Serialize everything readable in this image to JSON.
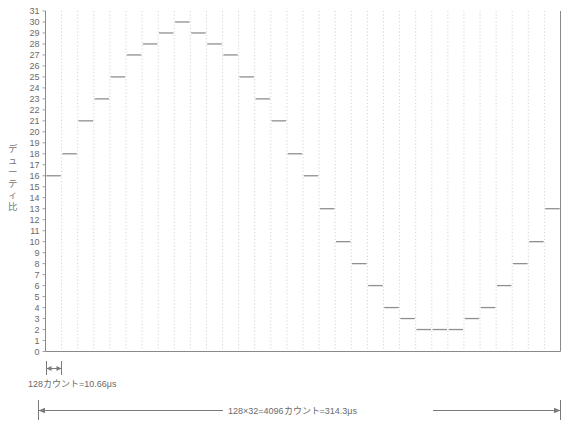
{
  "figure": {
    "caption_hidden": "",
    "axis": {
      "y_label": "デューティ比",
      "y_label_chars": [
        "デ",
        "ュ",
        "ー",
        "テ",
        "ィ",
        "比"
      ],
      "y_ticks": [
        0,
        1,
        2,
        3,
        4,
        5,
        6,
        7,
        8,
        9,
        10,
        11,
        12,
        13,
        14,
        15,
        16,
        17,
        18,
        19,
        20,
        21,
        22,
        23,
        24,
        25,
        26,
        27,
        28,
        29,
        30,
        31
      ],
      "y_min": 0,
      "y_max": 31
    },
    "annotations": {
      "step_marker": "128カウント=10.66μs",
      "total_span": "128×32=4096カウント=314.3μs"
    },
    "colors": {
      "axis": "#8a8a8a",
      "grid": "#cfcfcf",
      "step": "#8f8f8f",
      "text": "#6b6b6b",
      "background": "#ffffff"
    }
  },
  "chart_data": {
    "type": "bar",
    "title": "",
    "xlabel": "",
    "ylabel": "デューティ比",
    "ylim": [
      0,
      31
    ],
    "xlim": [
      0,
      32
    ],
    "grid": true,
    "legend": "none",
    "step_count": 32,
    "categories": [
      "1",
      "2",
      "3",
      "4",
      "5",
      "6",
      "7",
      "8",
      "9",
      "10",
      "11",
      "12",
      "13",
      "14",
      "15",
      "16",
      "17",
      "18",
      "19",
      "20",
      "21",
      "22",
      "23",
      "24",
      "25",
      "26",
      "27",
      "28",
      "29",
      "30",
      "31",
      "32"
    ],
    "values": [
      16,
      18,
      21,
      23,
      25,
      27,
      28,
      29,
      30,
      29,
      28,
      27,
      25,
      23,
      21,
      18,
      16,
      13,
      10,
      8,
      6,
      4,
      3,
      2,
      2,
      2,
      3,
      4,
      6,
      8,
      10,
      13
    ],
    "annotations": [
      {
        "text": "128カウント=10.66μs",
        "target": "one-step-width"
      },
      {
        "text": "128×32=4096カウント=314.3μs",
        "target": "full-width"
      }
    ]
  }
}
